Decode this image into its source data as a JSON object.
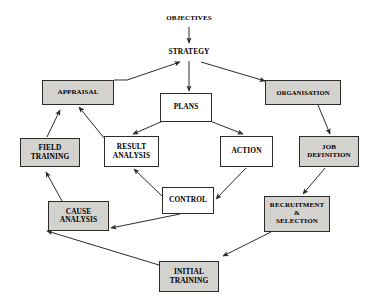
{
  "diagram": {
    "colors": {
      "fill_shaded": "#d4d2cf",
      "fill_plain": "#ffffff",
      "stroke": "#2b2b2b",
      "background": "#ffffff",
      "text": "#000000"
    },
    "nodes": [
      {
        "id": "objectives",
        "label": "OBJECTIVES",
        "shape": "text",
        "fill": "none",
        "x": 152,
        "y": 12,
        "w": 74,
        "h": 13
      },
      {
        "id": "strategy",
        "label": "STRATEGY",
        "shape": "text",
        "fill": "none",
        "x": 155,
        "y": 46,
        "w": 68,
        "h": 13
      },
      {
        "id": "appraisal",
        "label": "APPRAISAL",
        "shape": "box",
        "fill": "shaded",
        "x": 42,
        "y": 80,
        "w": 72,
        "h": 25
      },
      {
        "id": "plans",
        "label": "PLANS",
        "shape": "box",
        "fill": "plain",
        "x": 160,
        "y": 93,
        "w": 52,
        "h": 29
      },
      {
        "id": "organisation",
        "label": "ORGANISATION",
        "shape": "box",
        "fill": "shaded",
        "x": 265,
        "y": 80,
        "w": 76,
        "h": 25
      },
      {
        "id": "field_training",
        "label": "FIELD\nTRAINING",
        "shape": "box",
        "fill": "shaded",
        "x": 20,
        "y": 138,
        "w": 60,
        "h": 29
      },
      {
        "id": "result_analysis",
        "label": "RESULT\nANALYSIS",
        "shape": "box",
        "fill": "plain",
        "x": 104,
        "y": 136,
        "w": 55,
        "h": 31
      },
      {
        "id": "action",
        "label": "ACTION",
        "shape": "box",
        "fill": "plain",
        "x": 220,
        "y": 136,
        "w": 53,
        "h": 31
      },
      {
        "id": "job_definition",
        "label": "JOB\nDEFINITION",
        "shape": "box",
        "fill": "shaded",
        "x": 299,
        "y": 136,
        "w": 60,
        "h": 31
      },
      {
        "id": "control",
        "label": "CONTROL",
        "shape": "box",
        "fill": "plain",
        "x": 162,
        "y": 187,
        "w": 52,
        "h": 27
      },
      {
        "id": "cause_analysis",
        "label": "CAUSE\nANALYSIS",
        "shape": "box",
        "fill": "shaded",
        "x": 48,
        "y": 201,
        "w": 61,
        "h": 30
      },
      {
        "id": "recruitment_selection",
        "label": "RECRUITMENT\n&\nSELECTION",
        "shape": "box",
        "fill": "shaded",
        "x": 264,
        "y": 196,
        "w": 66,
        "h": 36
      },
      {
        "id": "initial_training",
        "label": "INITIAL\nTRAINING",
        "shape": "box",
        "fill": "shaded",
        "x": 159,
        "y": 261,
        "w": 60,
        "h": 31
      }
    ],
    "edges": [
      {
        "id": "objectives-to-strategy",
        "from": "objectives",
        "to": "strategy",
        "points": [
          [
            189,
            27
          ],
          [
            189,
            43
          ]
        ]
      },
      {
        "id": "appraisal-to-strategy",
        "from": "appraisal",
        "to": "strategy",
        "points": [
          [
            114,
            80
          ],
          [
            127,
            80
          ],
          [
            180,
            62
          ]
        ]
      },
      {
        "id": "strategy-to-plans",
        "from": "strategy",
        "to": "plans",
        "points": [
          [
            189,
            61
          ],
          [
            189,
            91
          ]
        ]
      },
      {
        "id": "strategy-to-organisation",
        "from": "strategy",
        "to": "organisation",
        "points": [
          [
            201,
            62
          ],
          [
            265,
            81
          ]
        ]
      },
      {
        "id": "plans-to-result-analysis",
        "from": "plans",
        "to": "result_analysis",
        "points": [
          [
            163,
            121
          ],
          [
            133,
            134
          ]
        ]
      },
      {
        "id": "plans-to-action",
        "from": "plans",
        "to": "action",
        "points": [
          [
            210,
            121
          ],
          [
            243,
            134
          ]
        ]
      },
      {
        "id": "organisation-to-job-definition",
        "from": "organisation",
        "to": "job_definition",
        "points": [
          [
            318,
            105
          ],
          [
            330,
            134
          ]
        ]
      },
      {
        "id": "result-analysis-to-appraisal",
        "from": "result_analysis",
        "to": "appraisal",
        "points": [
          [
            104,
            138
          ],
          [
            79,
            107
          ]
        ]
      },
      {
        "id": "field-training-to-appraisal",
        "from": "field_training",
        "to": "appraisal",
        "points": [
          [
            47,
            137
          ],
          [
            60,
            110
          ]
        ]
      },
      {
        "id": "action-to-control",
        "from": "action",
        "to": "control",
        "points": [
          [
            246,
            168
          ],
          [
            216,
            199
          ]
        ]
      },
      {
        "id": "control-to-result-analysis",
        "from": "control",
        "to": "result_analysis",
        "points": [
          [
            162,
            196
          ],
          [
            134,
            169
          ]
        ]
      },
      {
        "id": "control-to-cause-analysis",
        "from": "control",
        "to": "cause_analysis",
        "points": [
          [
            180,
            214
          ],
          [
            111,
            228
          ]
        ]
      },
      {
        "id": "job-definition-to-recruitment",
        "from": "job_definition",
        "to": "recruitment_selection",
        "points": [
          [
            325,
            168
          ],
          [
            303,
            194
          ]
        ]
      },
      {
        "id": "recruitment-to-initial-training",
        "from": "recruitment_selection",
        "to": "initial_training",
        "points": [
          [
            271,
            232
          ],
          [
            223,
            256
          ]
        ]
      },
      {
        "id": "initial-training-to-cause-analysis",
        "from": "initial_training",
        "to": "cause_analysis",
        "points": [
          [
            159,
            265
          ],
          [
            47,
            231
          ]
        ]
      },
      {
        "id": "cause-analysis-to-field-training",
        "from": "cause_analysis",
        "to": "field_training",
        "points": [
          [
            62,
            201
          ],
          [
            46,
            172
          ]
        ]
      }
    ]
  }
}
